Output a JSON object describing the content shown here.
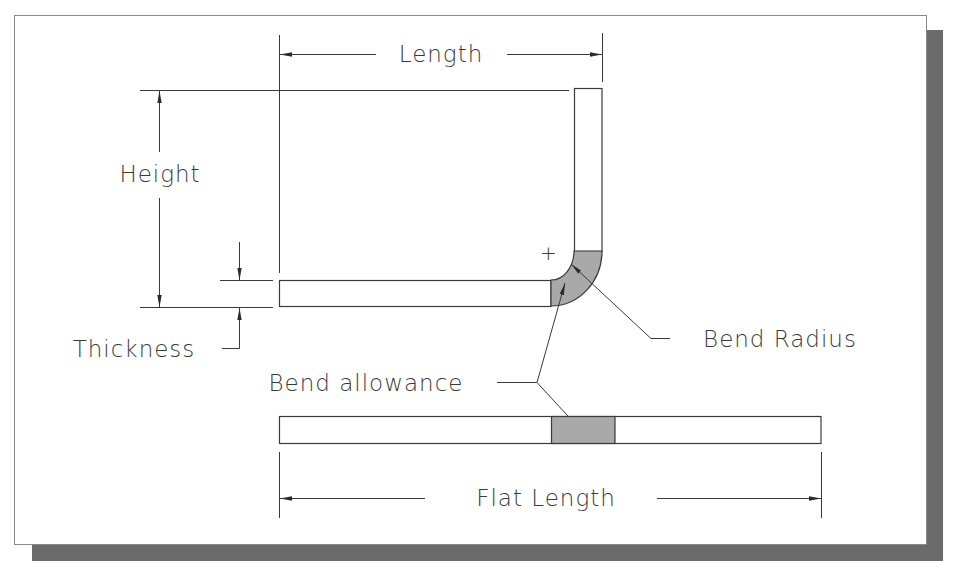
{
  "colors": {
    "background": "#ffffff",
    "frame_stroke": "#8a8a8a",
    "shadow": "#6b6b6b",
    "line": "#3a3a3a",
    "bend_fill": "#a9a9a9",
    "plate_fill": "#ffffff"
  },
  "labels": {
    "length": "Length",
    "height": "Height",
    "thickness": "Thickness",
    "bend_radius": "Bend Radius",
    "bend_allowance": "Bend allowance",
    "flat_length": "Flat Length"
  },
  "symbols": {
    "bend_center": "+"
  }
}
